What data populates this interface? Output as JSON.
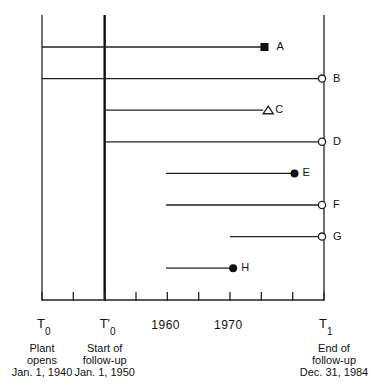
{
  "diagram": {
    "type": "cohort-follow-up-timeline",
    "axis": {
      "start_year": 1940,
      "end_year": 1985,
      "tick_years": [
        1940,
        1945,
        1950,
        1955,
        1960,
        1965,
        1970,
        1975,
        1980,
        1985
      ],
      "year_labels": [
        {
          "year": 1960,
          "text": "1960"
        },
        {
          "year": 1970,
          "text": "1970"
        }
      ]
    },
    "markers": [
      {
        "id": "T0",
        "symbol": "T",
        "sub": "0",
        "prime": "",
        "year": 1940,
        "caption": [
          "Plant",
          "opens",
          "Jan. 1, 1940"
        ]
      },
      {
        "id": "T0prime",
        "symbol": "T",
        "sub": "0",
        "prime": "'",
        "year": 1950,
        "caption": [
          "Start of",
          "follow-up",
          "Jan. 1, 1950"
        ]
      },
      {
        "id": "T1",
        "symbol": "T",
        "sub": "1",
        "prime": "",
        "year": 1985,
        "caption": [
          "End of",
          "follow-up",
          "Dec. 31, 1984"
        ]
      }
    ],
    "subjects": [
      {
        "label": "A",
        "start": 1940,
        "end": 1975.5,
        "end_marker": "filled-square"
      },
      {
        "label": "B",
        "start": 1940,
        "end": 1985,
        "end_marker": "open-circle"
      },
      {
        "label": "C",
        "start": 1950,
        "end": 1975.3,
        "end_marker": "open-triangle"
      },
      {
        "label": "D",
        "start": 1950,
        "end": 1985,
        "end_marker": "open-circle"
      },
      {
        "label": "E",
        "start": 1959.8,
        "end": 1980.3,
        "end_marker": "filled-circle"
      },
      {
        "label": "F",
        "start": 1959.8,
        "end": 1985,
        "end_marker": "open-circle"
      },
      {
        "label": "G",
        "start": 1970,
        "end": 1985,
        "end_marker": "open-circle"
      },
      {
        "label": "H",
        "start": 1959.8,
        "end": 1970.5,
        "end_marker": "filled-circle"
      }
    ]
  }
}
